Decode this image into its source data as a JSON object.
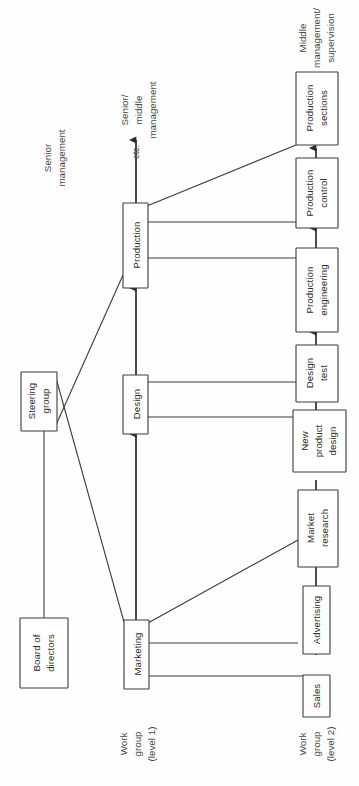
{
  "diagram": {
    "orientation": "rotated-90-ccw",
    "colors": {
      "background": "#fefefe",
      "box_fill": "#ffffff",
      "stroke": "#3a3a3a",
      "text": "#2b2b2b",
      "label_text": "#444444"
    },
    "boxes": [
      {
        "id": "board",
        "lines": [
          "Board of",
          "directors"
        ]
      },
      {
        "id": "steering-group",
        "lines": [
          "Steering",
          "group"
        ]
      },
      {
        "id": "production",
        "lines": [
          "Production"
        ]
      },
      {
        "id": "design",
        "lines": [
          "Design"
        ]
      },
      {
        "id": "marketing",
        "lines": [
          "Marketing"
        ]
      },
      {
        "id": "production-sections",
        "lines": [
          "Production",
          "sections"
        ]
      },
      {
        "id": "production-control",
        "lines": [
          "Production",
          "control"
        ]
      },
      {
        "id": "production-engineering",
        "lines": [
          "Production",
          "engineering"
        ]
      },
      {
        "id": "design-test",
        "lines": [
          "Design",
          "test"
        ]
      },
      {
        "id": "new-product-design",
        "lines": [
          "New",
          "product",
          "design"
        ]
      },
      {
        "id": "market-research",
        "lines": [
          "Market",
          "research"
        ]
      },
      {
        "id": "advertising",
        "lines": [
          "Advertising"
        ]
      },
      {
        "id": "sales",
        "lines": [
          "Sales"
        ]
      }
    ],
    "annotations": [
      {
        "id": "senior-management",
        "lines": [
          "Senior",
          "management"
        ]
      },
      {
        "id": "senior-middle-management",
        "lines": [
          "Senior/",
          "middle",
          "management"
        ]
      },
      {
        "id": "etc",
        "lines": [
          "etc."
        ]
      },
      {
        "id": "middle-management",
        "lines": [
          "Middle",
          "management/",
          "supervision"
        ]
      },
      {
        "id": "work-group-level-1",
        "lines": [
          "Work",
          "group",
          "(level 1)"
        ]
      },
      {
        "id": "work-group-level-2",
        "lines": [
          "Work",
          "group",
          "(level 2)"
        ]
      }
    ]
  }
}
